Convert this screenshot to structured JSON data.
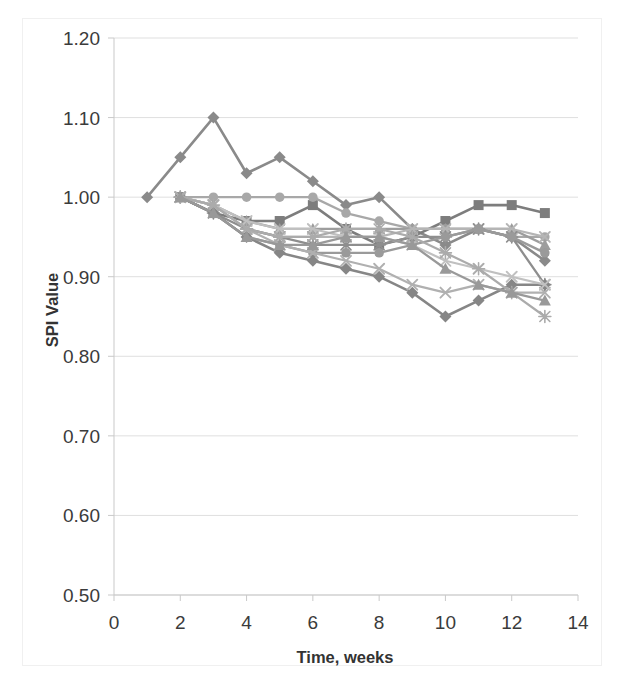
{
  "chart_data": {
    "type": "line",
    "title": "",
    "xlabel": "Time, weeks",
    "ylabel": "SPI Value",
    "xlim": [
      0,
      14
    ],
    "ylim": [
      0.5,
      1.2
    ],
    "xticks": [
      0,
      2,
      4,
      6,
      8,
      10,
      12,
      14
    ],
    "yticks": [
      0.5,
      0.6,
      0.7,
      0.8,
      0.9,
      1.0,
      1.1,
      1.2
    ],
    "xtick_labels": [
      "0",
      "2",
      "4",
      "6",
      "8",
      "10",
      "12",
      "14"
    ],
    "ytick_labels": [
      "0.50",
      "0.60",
      "0.70",
      "0.80",
      "0.90",
      "1.00",
      "1.10",
      "1.20"
    ],
    "grid": true,
    "grid_axis": "y",
    "legend": "none",
    "marker_size": 5,
    "series": [
      {
        "name": "Project 1",
        "color": "#8a8a8a",
        "marker": "diamond",
        "width": 2.6,
        "x": [
          1,
          2,
          3,
          4,
          5,
          6,
          7,
          8,
          9,
          10,
          11,
          12,
          13
        ],
        "values": [
          1.0,
          1.05,
          1.1,
          1.03,
          1.05,
          1.02,
          0.99,
          1.0,
          0.96,
          0.94,
          0.96,
          0.95,
          0.92
        ]
      },
      {
        "name": "Project 2",
        "color": "#7d7d7d",
        "marker": "square",
        "width": 2.6,
        "x": [
          2,
          3,
          4,
          5,
          6,
          7,
          8,
          9,
          10,
          11,
          12,
          13
        ],
        "values": [
          1.0,
          0.98,
          0.97,
          0.97,
          0.99,
          0.96,
          0.94,
          0.95,
          0.97,
          0.99,
          0.99,
          0.98
        ]
      },
      {
        "name": "Project 3",
        "color": "#a8a8a8",
        "marker": "circle",
        "width": 2.3,
        "x": [
          2,
          3,
          4,
          5,
          6,
          7,
          8,
          9,
          10,
          11,
          12,
          13
        ],
        "values": [
          1.0,
          1.0,
          1.0,
          1.0,
          1.0,
          0.98,
          0.97,
          0.96,
          0.96,
          0.96,
          0.95,
          0.95
        ]
      },
      {
        "name": "Project 4",
        "color": "#9d9d9d",
        "marker": "triangle",
        "width": 2.3,
        "x": [
          2,
          3,
          4,
          5,
          6,
          7,
          8,
          9,
          10,
          11,
          12,
          13
        ],
        "values": [
          1.0,
          0.99,
          0.97,
          0.96,
          0.96,
          0.96,
          0.96,
          0.96,
          0.96,
          0.96,
          0.96,
          0.94
        ]
      },
      {
        "name": "Project 5",
        "color": "#b5b5b5",
        "marker": "x",
        "width": 2.2,
        "x": [
          2,
          3,
          4,
          5,
          6,
          7,
          8,
          9,
          10,
          11,
          12,
          13
        ],
        "values": [
          1.0,
          0.99,
          0.96,
          0.95,
          0.95,
          0.95,
          0.95,
          0.96,
          0.96,
          0.96,
          0.96,
          0.95
        ]
      },
      {
        "name": "Project 6",
        "color": "#8e8e8e",
        "marker": "asterisk",
        "width": 2.3,
        "x": [
          2,
          3,
          4,
          5,
          6,
          7,
          8,
          9,
          10,
          11,
          12,
          13
        ],
        "values": [
          1.0,
          0.98,
          0.96,
          0.95,
          0.94,
          0.94,
          0.94,
          0.95,
          0.95,
          0.96,
          0.95,
          0.89
        ]
      },
      {
        "name": "Project 7",
        "color": "#9a9a9a",
        "marker": "circle",
        "width": 2.4,
        "x": [
          2,
          3,
          4,
          5,
          6,
          7,
          8,
          9,
          10,
          11,
          12,
          13
        ],
        "values": [
          1.0,
          0.98,
          0.95,
          0.94,
          0.93,
          0.93,
          0.93,
          0.94,
          0.95,
          0.96,
          0.95,
          0.93
        ]
      },
      {
        "name": "Project 8",
        "color": "#868686",
        "marker": "diamond",
        "width": 2.5,
        "x": [
          2,
          3,
          4,
          5,
          6,
          7,
          8,
          9,
          10,
          11,
          12,
          13
        ],
        "values": [
          1.0,
          0.98,
          0.95,
          0.93,
          0.92,
          0.91,
          0.9,
          0.88,
          0.85,
          0.87,
          0.89,
          0.89
        ]
      },
      {
        "name": "Project 9",
        "color": "#b0b0b0",
        "marker": "x",
        "width": 2.2,
        "x": [
          2,
          3,
          4,
          5,
          6,
          7,
          8,
          9,
          10,
          11,
          12,
          13
        ],
        "values": [
          1.0,
          0.99,
          0.96,
          0.94,
          0.93,
          0.92,
          0.91,
          0.89,
          0.88,
          0.89,
          0.88,
          0.88
        ]
      },
      {
        "name": "Project 10",
        "color": "#c0c0c0",
        "marker": "x",
        "width": 2.2,
        "x": [
          2,
          3,
          4,
          5,
          6,
          7,
          8,
          9,
          10,
          11,
          12,
          13
        ],
        "values": [
          1.0,
          0.99,
          0.97,
          0.96,
          0.96,
          0.95,
          0.95,
          0.94,
          0.92,
          0.91,
          0.9,
          0.89
        ]
      },
      {
        "name": "Project 11",
        "color": "#ababab",
        "marker": "asterisk",
        "width": 2.2,
        "x": [
          2,
          3,
          4,
          5,
          6,
          7,
          8,
          9,
          10,
          11,
          12,
          13
        ],
        "values": [
          1.0,
          0.99,
          0.96,
          0.95,
          0.95,
          0.96,
          0.96,
          0.95,
          0.93,
          0.91,
          0.88,
          0.85
        ]
      },
      {
        "name": "Project 12",
        "color": "#999999",
        "marker": "triangle",
        "width": 2.3,
        "x": [
          2,
          3,
          4,
          5,
          6,
          7,
          8,
          9,
          10,
          11,
          12,
          13
        ],
        "values": [
          1.0,
          0.98,
          0.95,
          0.94,
          0.94,
          0.95,
          0.95,
          0.94,
          0.91,
          0.89,
          0.88,
          0.87
        ]
      }
    ]
  },
  "axes": {
    "y_title": "SPI Value",
    "x_title": "Time, weeks"
  }
}
